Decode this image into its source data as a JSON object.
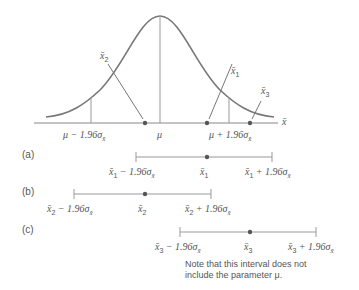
{
  "figure": {
    "axis_label": "x̄",
    "curve_labels": {
      "mu": "μ",
      "lower": {
        "prefix": "μ − 1.96σ",
        "sub": "x̄"
      },
      "upper": {
        "prefix": "μ + 1.96σ",
        "sub": "x̄"
      }
    },
    "samples": [
      {
        "id": "x1",
        "name": "x̄",
        "sub": "1"
      },
      {
        "id": "x2",
        "name": "x̄",
        "sub": "2"
      },
      {
        "id": "x3",
        "name": "x̄",
        "sub": "3"
      }
    ]
  },
  "intervals": [
    {
      "tag": "(a)",
      "left": {
        "name": "x̄",
        "sub": "1",
        "op": " − 1.96σ",
        "sig_sub": "x̄"
      },
      "center": {
        "name": "x̄",
        "sub": "1"
      },
      "right": {
        "name": "x̄",
        "sub": "1",
        "op": " + 1.96σ",
        "sig_sub": "x̄"
      }
    },
    {
      "tag": "(b)",
      "left": {
        "name": "x̄",
        "sub": "2",
        "op": " − 1.96σ",
        "sig_sub": "x̄"
      },
      "center": {
        "name": "x̄",
        "sub": "2"
      },
      "right": {
        "name": "x̄",
        "sub": "2",
        "op": " + 1.96σ",
        "sig_sub": "x̄"
      }
    },
    {
      "tag": "(c)",
      "left": {
        "name": "x̄",
        "sub": "3",
        "op": " − 1.96σ",
        "sig_sub": "x̄"
      },
      "center": {
        "name": "x̄",
        "sub": "3"
      },
      "right": {
        "name": "x̄",
        "sub": "3",
        "op": " + 1.96σ",
        "sig_sub": "x̄"
      }
    }
  ],
  "note": {
    "line1": "Note that this interval does not",
    "line2": "include the parameter μ."
  }
}
